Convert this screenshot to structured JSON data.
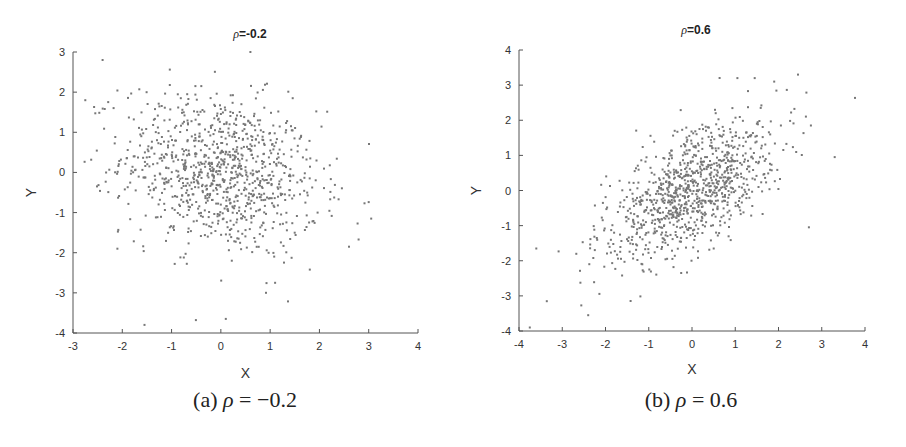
{
  "chart_data": [
    {
      "type": "scatter",
      "panel": "a",
      "title": "ρ=-0.2",
      "title_symbol": "ρ",
      "title_value": "=-0.2",
      "caption_prefix": "(a)",
      "caption_symbol": "ρ",
      "caption_value": "= −0.2",
      "correlation": -0.2,
      "n_points": 1000,
      "xlabel": "X",
      "ylabel": "Y",
      "xlim": [
        -3,
        4
      ],
      "ylim": [
        -4,
        3
      ],
      "xticks": [
        -3,
        -2,
        -1,
        0,
        1,
        2,
        3,
        4
      ],
      "yticks": [
        -4,
        -3,
        -2,
        -1,
        0,
        1,
        2,
        3
      ],
      "grid": false,
      "legend": null,
      "marker_color": "#777777",
      "outliers": [
        [
          0.6,
          3.0
        ],
        [
          -2.4,
          2.8
        ],
        [
          0.1,
          -3.65
        ],
        [
          3.05,
          -1.15
        ],
        [
          1.1,
          -2.75
        ],
        [
          -2.75,
          1.8
        ],
        [
          -2.1,
          -1.9
        ],
        [
          2.6,
          -1.85
        ]
      ]
    },
    {
      "type": "scatter",
      "panel": "b",
      "title": "ρ=0.6",
      "title_symbol": "ρ",
      "title_value": "=0.6",
      "caption_prefix": "(b)",
      "caption_symbol": "ρ",
      "caption_value": "= 0.6",
      "correlation": 0.6,
      "n_points": 1000,
      "xlabel": "X",
      "ylabel": "Y",
      "xlim": [
        -4,
        4
      ],
      "ylim": [
        -4,
        4
      ],
      "xticks": [
        -4,
        -3,
        -2,
        -1,
        0,
        1,
        2,
        3,
        4
      ],
      "yticks": [
        -4,
        -3,
        -2,
        -1,
        0,
        1,
        2,
        3,
        4
      ],
      "grid": false,
      "legend": null,
      "marker_color": "#777777",
      "outliers": [
        [
          2.45,
          3.3
        ],
        [
          1.05,
          3.2
        ],
        [
          1.45,
          3.2
        ],
        [
          1.9,
          3.1
        ],
        [
          3.3,
          0.95
        ],
        [
          2.75,
          1.85
        ],
        [
          -3.75,
          -3.9
        ],
        [
          -2.4,
          -3.55
        ],
        [
          -3.6,
          -1.65
        ],
        [
          -0.25,
          -2.35
        ]
      ]
    }
  ]
}
